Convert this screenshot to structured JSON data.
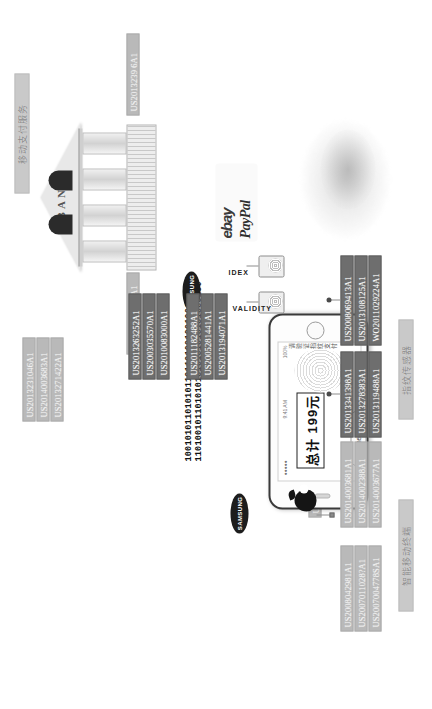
{
  "figure": {
    "title_zh": "移动支付服务",
    "caption_left_zh": "智能移动终端",
    "caption_right_zh": "指纹传感器"
  },
  "bank": {
    "sign": "BANK"
  },
  "payment_logos": {
    "ebay": "ebay",
    "paypal": "PayPal"
  },
  "binary": {
    "line1": "1001010110101011011010010010010011",
    "line2": "1101001011010101010101010101000100"
  },
  "phone": {
    "status_time": "9:41 AM",
    "status_battery": "100%",
    "status_carrier": "●●●●●",
    "amount_label": "总计",
    "amount_value": "199元",
    "amount_full": "总计  199元",
    "side_caption": "请验证指纹支付"
  },
  "brands": {
    "samsung": "SAMSUNG",
    "apple": "apple-logo",
    "authentec": "AuthenTec",
    "validity": "VALIDITY",
    "idex": "IDEX"
  },
  "label_groups": {
    "bank_patent": [
      "US2014058941A1"
    ],
    "mobile_service_patent": [
      "US2013239 6A1"
    ],
    "top_left_patents": [
      "US2013231046A1",
      "US2014003683A1",
      "US2013271422A1"
    ],
    "apple_top_patent": [
      "US2010002444A1"
    ],
    "sensor_mid_patents": [
      "US2013263252A1",
      "US2003035570A1",
      "US2010083000A1"
    ],
    "sensor_right_patents": [
      "US2011182488A1",
      "US2005281441A1",
      "US2013194071A1"
    ],
    "terminal_patents": [
      "US2008042981A1",
      "US2007011028?A1",
      "US2007004778SA1"
    ],
    "apple_bottom_patents": [
      "US2014003681A1",
      "US2014002388A1",
      "US2014003677A1"
    ],
    "authentec_patents": [
      "US2013341398A1",
      "US2013278383A1",
      "US2013119488A1"
    ],
    "idex_patents": [
      "US2008069413A1",
      "US2013108125A1",
      "WO2011029224A1"
    ]
  },
  "colors": {
    "label_bg": "#b9b9b9",
    "label_bg_dark": "#6e6e6e",
    "line": "#8e8e8e",
    "ink": "#151515"
  }
}
